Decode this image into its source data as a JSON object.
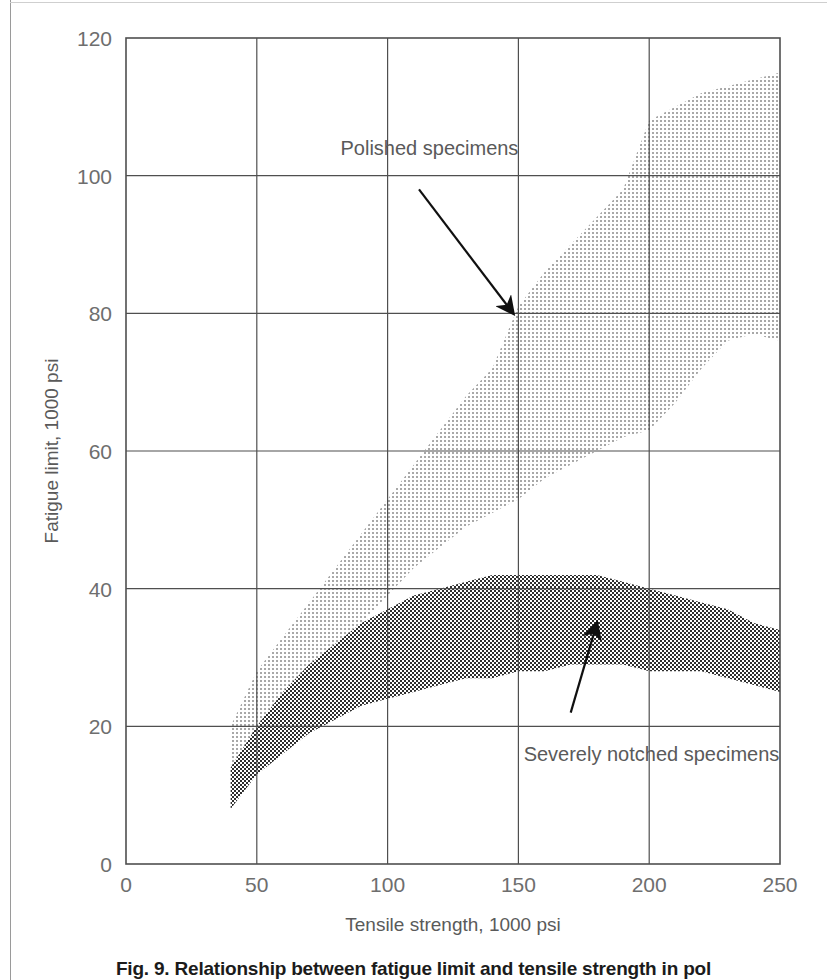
{
  "figure": {
    "caption": "Fig. 9. Relationship between fatigue limit and tensile strength in pol",
    "caption_truncated": true
  },
  "chart_data": {
    "type": "area",
    "title": "",
    "xlabel": "Tensile strength, 1000 psi",
    "ylabel": "Fatigue limit, 1000 psi",
    "xlim": [
      0,
      250
    ],
    "ylim": [
      0,
      120
    ],
    "xticks": [
      0,
      50,
      100,
      150,
      200,
      250
    ],
    "yticks": [
      0,
      20,
      40,
      60,
      80,
      100,
      120
    ],
    "grid": true,
    "legend_position": "inline-annotations",
    "series": [
      {
        "name": "Polished specimens",
        "style": "light-stipple-band",
        "fill": "#b9b9b9",
        "x": [
          40,
          50,
          60,
          70,
          80,
          90,
          100,
          110,
          120,
          130,
          140,
          150,
          160,
          170,
          180,
          190,
          200,
          210,
          220,
          230,
          240,
          250
        ],
        "upper": [
          20,
          28,
          33,
          38,
          43,
          48,
          53,
          58,
          63,
          68,
          72,
          81,
          86,
          90,
          94,
          98,
          108,
          110,
          112,
          113,
          114,
          115
        ],
        "lower": [
          12,
          19,
          23,
          27,
          31,
          35,
          39,
          43,
          46,
          49,
          51,
          53,
          56,
          58,
          60,
          62,
          63,
          67,
          72,
          76,
          77,
          76
        ]
      },
      {
        "name": "Severely notched specimens",
        "style": "dark-checker-band",
        "fill": "#6f6f6f",
        "x": [
          40,
          50,
          60,
          70,
          80,
          90,
          100,
          110,
          120,
          130,
          140,
          150,
          160,
          170,
          180,
          190,
          200,
          210,
          220,
          230,
          240,
          250
        ],
        "upper": [
          14,
          20,
          25,
          29,
          32,
          35,
          37,
          39,
          40,
          41,
          42,
          42,
          42,
          42,
          42,
          41,
          40,
          39,
          38,
          37,
          35,
          34
        ],
        "lower": [
          8,
          13,
          16,
          19,
          21,
          23,
          24,
          25,
          26,
          27,
          27,
          28,
          28,
          29,
          29,
          29,
          28,
          28,
          28,
          27,
          26,
          25
        ]
      }
    ],
    "annotations": [
      {
        "text": "Polished specimens",
        "text_x": 82,
        "text_y": 103,
        "arrow_from_x": 112,
        "arrow_from_y": 98,
        "arrow_to_x": 148,
        "arrow_to_y": 80
      },
      {
        "text": "Severely notched specimens",
        "text_x": 152,
        "text_y": 15,
        "arrow_from_x": 170,
        "arrow_from_y": 22,
        "arrow_to_x": 180,
        "arrow_to_y": 35
      }
    ]
  }
}
